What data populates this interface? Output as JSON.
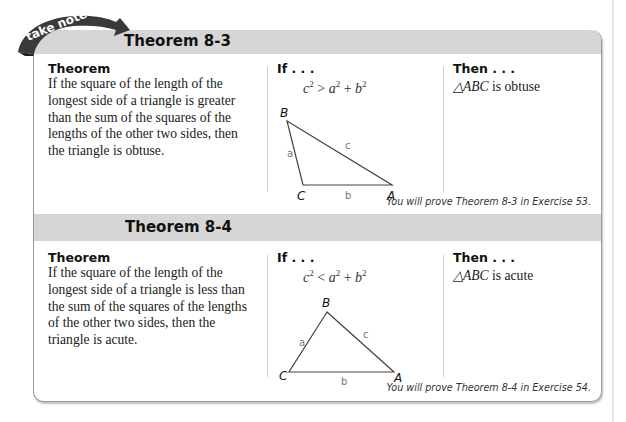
{
  "banner": {
    "text": "take note"
  },
  "theorems": [
    {
      "title": "Theorem 8-3",
      "theorem_label": "Theorem",
      "statement": "If the square of the length of the longest side of a triangle is greater than the sum of the squares of the lengths of the other two sides, then the triangle is obtuse.",
      "if_label": "If . . .",
      "formula": {
        "lhs": "c",
        "op": ">",
        "a": "a",
        "b": "b",
        "exp": "2",
        "plus": "+"
      },
      "diagram": {
        "vertices": [
          "B",
          "C",
          "A"
        ],
        "sides": [
          "a",
          "b",
          "c"
        ]
      },
      "then_label": "Then . . .",
      "then_triangle": "△ABC",
      "then_text": " is obtuse",
      "footnote": "You will prove Theorem 8-3 in Exercise 53."
    },
    {
      "title": "Theorem 8-4",
      "theorem_label": "Theorem",
      "statement": "If the square of the length of the longest side of a triangle is less than the sum of the squares of the lengths of the other two sides, then the triangle is acute.",
      "if_label": "If . . .",
      "formula": {
        "lhs": "c",
        "op": "<",
        "a": "a",
        "b": "b",
        "exp": "2",
        "plus": "+"
      },
      "diagram": {
        "vertices": [
          "B",
          "C",
          "A"
        ],
        "sides": [
          "a",
          "b",
          "c"
        ]
      },
      "then_label": "Then . . .",
      "then_triangle": "△ABC",
      "then_text": " is acute",
      "footnote": "You will prove Theorem 8-4 in Exercise 54."
    }
  ]
}
